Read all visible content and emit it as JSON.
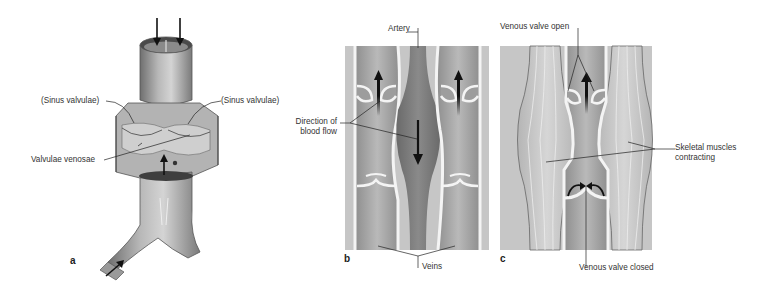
{
  "figure": {
    "panels": [
      {
        "id": "a",
        "letter": "a",
        "description": "Opened vein segment showing venous valves"
      },
      {
        "id": "b",
        "letter": "b",
        "description": "Veins alongside artery with direction of blood flow"
      },
      {
        "id": "c",
        "letter": "c",
        "description": "Skeletal muscle pump with venous valves"
      }
    ],
    "labels": {
      "sinus_left": "(Sinus valvulae)",
      "sinus_right": "(Sinus valvulae)",
      "valvulae_venosae": "Valvulae venosae",
      "artery": "Artery",
      "direction_line1": "Direction of",
      "direction_line2": "blood flow",
      "veins": "Veins",
      "valve_open": "Venous valve open",
      "muscles_line1": "Skeletal muscles",
      "muscles_line2": "contracting",
      "valve_closed": "Venous valve closed"
    },
    "colors": {
      "background": "#ffffff",
      "panel_bg": "#c9c9c9",
      "vein_fill": "#a9a9a9",
      "artery_fill": "#7d7d7d",
      "wall": "#f2f2f2",
      "outline": "#666666",
      "arrow": "#111111",
      "leader": "#222222"
    }
  }
}
